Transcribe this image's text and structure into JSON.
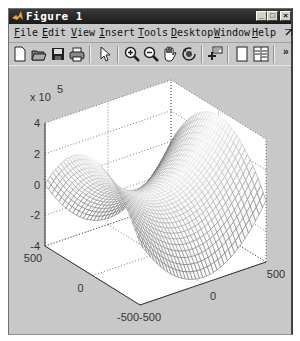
{
  "window": {
    "title": "Figure 1",
    "controls": {
      "minimize": "_",
      "maximize": "□",
      "close": "×"
    }
  },
  "menu": {
    "items": [
      "File",
      "Edit",
      "View",
      "Insert",
      "Tools",
      "Desktop",
      "Window",
      "Help"
    ],
    "overflow_icon": "dock-arrow-icon"
  },
  "toolbar": {
    "tools": [
      {
        "name": "new-figure",
        "icon": "new-file-icon"
      },
      {
        "name": "open-file",
        "icon": "open-folder-icon"
      },
      {
        "name": "save-figure",
        "icon": "save-icon"
      },
      {
        "name": "print-figure",
        "icon": "print-icon"
      },
      {
        "name": "edit-plot",
        "icon": "arrow-cursor-icon"
      },
      {
        "name": "zoom-in",
        "icon": "zoom-in-icon"
      },
      {
        "name": "zoom-out",
        "icon": "zoom-out-icon"
      },
      {
        "name": "pan",
        "icon": "hand-icon"
      },
      {
        "name": "rotate-3d",
        "icon": "rotate-icon"
      },
      {
        "name": "data-cursor",
        "icon": "data-cursor-icon"
      },
      {
        "name": "hide-plot-tools",
        "icon": "panel-icon"
      },
      {
        "name": "show-plot-tools",
        "icon": "panel-dock-icon"
      }
    ],
    "overflow_label": "»"
  },
  "chart_data": {
    "type": "mesh",
    "title": "",
    "function": "z = x^2 - y^2 (saddle surface)",
    "x_range": [
      -500,
      500
    ],
    "y_range": [
      -500,
      500
    ],
    "z_range": [
      -4,
      4
    ],
    "z_exponent_label": "x 10",
    "z_exponent": "5",
    "x_ticks": [
      "-500",
      "0",
      "500"
    ],
    "y_ticks": [
      "-500",
      "0",
      "500"
    ],
    "z_ticks": [
      "-4",
      "-2",
      "0",
      "2",
      "4"
    ],
    "grid": true,
    "colormap": "grayscale"
  }
}
